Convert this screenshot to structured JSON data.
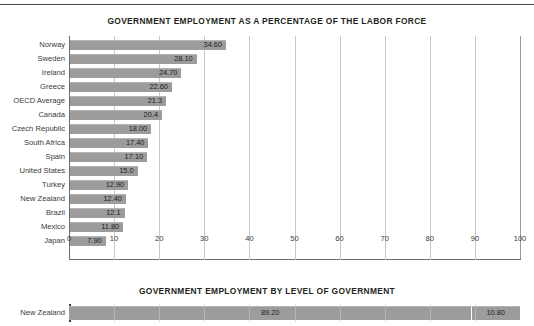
{
  "chart_data": [
    {
      "type": "bar",
      "orientation": "horizontal",
      "title": "GOVERNMENT EMPLOYMENT AS A PERCENTAGE OF THE LABOR FORCE",
      "xlabel": "",
      "ylabel": "",
      "xlim": [
        0,
        100
      ],
      "xticks": [
        "0",
        "10",
        "20",
        "30",
        "40",
        "50",
        "60",
        "70",
        "80",
        "90",
        "100"
      ],
      "grid": true,
      "legend": "none",
      "bar_color": "#9c9c9c",
      "categories": [
        "Norway",
        "Sweden",
        "Ireland",
        "Greece",
        "OECD Average",
        "Canada",
        "Czech Republic",
        "South Africa",
        "Spain",
        "United States",
        "Turkey",
        "New Zealand",
        "Brazil",
        "Mexico",
        "Japan"
      ],
      "values": [
        34.6,
        28.1,
        24.7,
        22.6,
        21.3,
        20.4,
        18.0,
        17.4,
        17.1,
        15.0,
        12.9,
        12.4,
        12.1,
        11.8,
        7.9
      ],
      "value_labels": [
        "34.60",
        "28.10",
        "24.70",
        "22.60",
        "21.3",
        "20.4",
        "18.00",
        "17.40",
        "17.10",
        "15.0",
        "12.90",
        "12.40",
        "12.1",
        "11.80",
        "7.90"
      ]
    },
    {
      "type": "bar",
      "orientation": "horizontal",
      "subtype": "stacked",
      "title": "GOVERNMENT EMPLOYMENT BY LEVEL OF GOVERNMENT",
      "xlabel": "",
      "ylabel": "",
      "xlim": [
        0,
        100
      ],
      "grid": true,
      "legend": "none",
      "bar_color": "#9c9c9c",
      "categories": [
        "New Zealand"
      ],
      "series": [
        {
          "name": "segment-1",
          "values": [
            89.2
          ],
          "value_labels": [
            "89.20"
          ]
        },
        {
          "name": "segment-2",
          "values": [
            10.8
          ],
          "value_labels": [
            "10.80"
          ]
        }
      ]
    }
  ]
}
